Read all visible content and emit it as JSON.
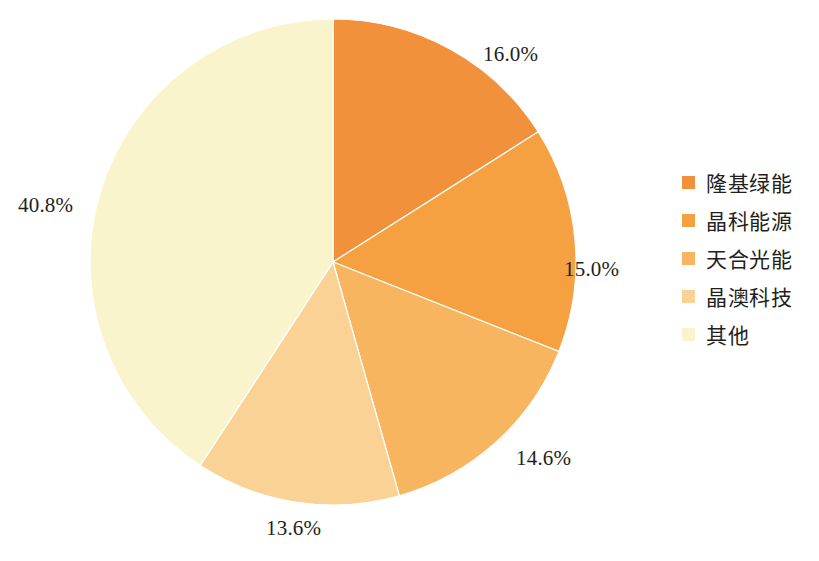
{
  "chart_data": {
    "type": "pie",
    "title": "",
    "subtitle": "",
    "xlabel": "",
    "ylabel": "",
    "legend_position": "right",
    "grid": false,
    "start_angle_deg": 90,
    "direction": "clockwise",
    "center": {
      "x": 333,
      "y": 262
    },
    "radius": 243,
    "categories": [
      "隆基绿能",
      "晶科能源",
      "天合光能",
      "晶澳科技",
      "其他"
    ],
    "values": [
      16.0,
      15.0,
      14.6,
      13.6,
      40.8
    ],
    "value_suffix": "%",
    "colors": [
      "#F2913C",
      "#F6A141",
      "#F8B560",
      "#FAD296",
      "#FAF4CD"
    ],
    "slices": [
      {
        "label": "隆基绿能",
        "value": 16.0,
        "display": "16.0%",
        "color": "#F2913C",
        "label_x": 483,
        "label_y": 42
      },
      {
        "label": "晶科能源",
        "value": 15.0,
        "display": "15.0%",
        "color": "#F6A141",
        "label_x": 564,
        "label_y": 257
      },
      {
        "label": "天合光能",
        "value": 14.6,
        "display": "14.6%",
        "color": "#F8B560",
        "label_x": 516,
        "label_y": 446
      },
      {
        "label": "晶澳科技",
        "value": 13.6,
        "display": "13.6%",
        "color": "#FAD296",
        "label_x": 266,
        "label_y": 516
      },
      {
        "label": "其他",
        "value": 40.8,
        "display": "40.8%",
        "color": "#FAF4CD",
        "label_x": 18,
        "label_y": 193
      }
    ]
  },
  "legend": {
    "items": [
      {
        "label": "隆基绿能",
        "color": "#F2913C"
      },
      {
        "label": "晶科能源",
        "color": "#F6A141"
      },
      {
        "label": "天合光能",
        "color": "#F8B560"
      },
      {
        "label": "晶澳科技",
        "color": "#FAD296"
      },
      {
        "label": "其他",
        "color": "#FAF4CD"
      }
    ]
  },
  "caption": {
    "text": ""
  }
}
